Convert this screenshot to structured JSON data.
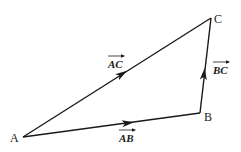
{
  "diagram": {
    "type": "vector-triangle",
    "points": {
      "A": {
        "label": "A",
        "x": 23,
        "y": 137
      },
      "B": {
        "label": "B",
        "x": 200,
        "y": 113
      },
      "C": {
        "label": "C",
        "x": 211,
        "y": 18
      }
    },
    "vectors": [
      {
        "from": "A",
        "to": "B",
        "label": "AB"
      },
      {
        "from": "B",
        "to": "C",
        "label": "BC"
      },
      {
        "from": "A",
        "to": "C",
        "label": "AC"
      }
    ],
    "colors": {
      "ink": "#1a1a1a",
      "background": "#ffffff"
    }
  }
}
